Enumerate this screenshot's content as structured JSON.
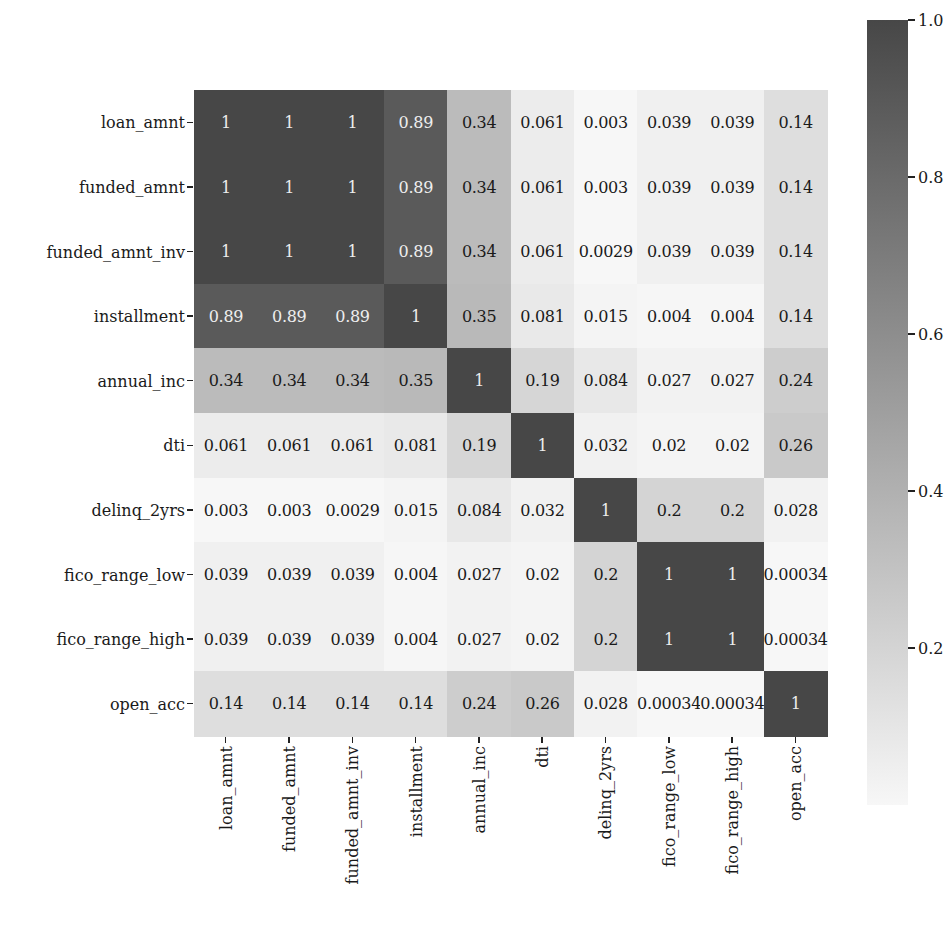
{
  "chart_data": {
    "type": "heatmap",
    "title": "",
    "xlabel": "",
    "ylabel": "",
    "labels": [
      "loan_amnt",
      "funded_amnt",
      "funded_amnt_inv",
      "installment",
      "annual_inc",
      "dti",
      "delinq_2yrs",
      "fico_range_low",
      "fico_range_high",
      "open_acc"
    ],
    "x_labels": [
      "loan_amnt",
      "funded_amnt",
      "funded_amnt_inv",
      "installment",
      "annual_inc",
      "dti",
      "delinq_2yrs",
      "fico_range_low",
      "fico_range_high",
      "open_acc"
    ],
    "y_labels": [
      "loan_amnt",
      "funded_amnt",
      "funded_amnt_inv",
      "installment",
      "annual_inc",
      "dti",
      "delinq_2yrs",
      "fico_range_low",
      "fico_range_high",
      "open_acc"
    ],
    "values": [
      [
        1,
        1,
        1,
        0.89,
        0.34,
        0.061,
        0.003,
        0.039,
        0.039,
        0.14
      ],
      [
        1,
        1,
        1,
        0.89,
        0.34,
        0.061,
        0.003,
        0.039,
        0.039,
        0.14
      ],
      [
        1,
        1,
        1,
        0.89,
        0.34,
        0.061,
        0.0029,
        0.039,
        0.039,
        0.14
      ],
      [
        0.89,
        0.89,
        0.89,
        1,
        0.35,
        0.081,
        0.015,
        0.004,
        0.004,
        0.14
      ],
      [
        0.34,
        0.34,
        0.34,
        0.35,
        1,
        0.19,
        0.084,
        0.027,
        0.027,
        0.24
      ],
      [
        0.061,
        0.061,
        0.061,
        0.081,
        0.19,
        1,
        0.032,
        0.02,
        0.02,
        0.26
      ],
      [
        0.003,
        0.003,
        0.0029,
        0.015,
        0.084,
        0.032,
        1,
        0.2,
        0.2,
        0.028
      ],
      [
        0.039,
        0.039,
        0.039,
        0.004,
        0.027,
        0.02,
        0.2,
        1,
        1,
        0.00034
      ],
      [
        0.039,
        0.039,
        0.039,
        0.004,
        0.027,
        0.02,
        0.2,
        1,
        1,
        0.00034
      ],
      [
        0.14,
        0.14,
        0.14,
        0.14,
        0.24,
        0.26,
        0.028,
        0.00034,
        0.00034,
        1
      ]
    ],
    "annotations": [
      [
        "1",
        "1",
        "1",
        "0.89",
        "0.34",
        "0.061",
        "0.003",
        "0.039",
        "0.039",
        "0.14"
      ],
      [
        "1",
        "1",
        "1",
        "0.89",
        "0.34",
        "0.061",
        "0.003",
        "0.039",
        "0.039",
        "0.14"
      ],
      [
        "1",
        "1",
        "1",
        "0.89",
        "0.34",
        "0.061",
        "0.0029",
        "0.039",
        "0.039",
        "0.14"
      ],
      [
        "0.89",
        "0.89",
        "0.89",
        "1",
        "0.35",
        "0.081",
        "0.015",
        "0.004",
        "0.004",
        "0.14"
      ],
      [
        "0.34",
        "0.34",
        "0.34",
        "0.35",
        "1",
        "0.19",
        "0.084",
        "0.027",
        "0.027",
        "0.24"
      ],
      [
        "0.061",
        "0.061",
        "0.061",
        "0.081",
        "0.19",
        "1",
        "0.032",
        "0.02",
        "0.02",
        "0.26"
      ],
      [
        "0.003",
        "0.003",
        "0.0029",
        "0.015",
        "0.084",
        "0.032",
        "1",
        "0.2",
        "0.2",
        "0.028"
      ],
      [
        "0.039",
        "0.039",
        "0.039",
        "0.004",
        "0.027",
        "0.02",
        "0.2",
        "1",
        "1",
        "0.00034"
      ],
      [
        "0.039",
        "0.039",
        "0.039",
        "0.004",
        "0.027",
        "0.02",
        "0.2",
        "1",
        "1",
        "0.00034"
      ],
      [
        "0.14",
        "0.14",
        "0.14",
        "0.14",
        "0.24",
        "0.26",
        "0.028",
        "0.00034",
        "0.00034",
        "1"
      ]
    ],
    "colorbar": {
      "ticks": [
        1.0,
        0.8,
        0.6,
        0.4,
        0.2
      ],
      "tick_labels": [
        "1.0",
        "0.8",
        "0.6",
        "0.4",
        "0.2"
      ],
      "vmin": 0.00034,
      "vmax": 1.0,
      "position": "right"
    },
    "colormap": {
      "low": "#f7f7f7",
      "high": "#474747"
    },
    "grid": false,
    "legend": "colorbar-right"
  }
}
